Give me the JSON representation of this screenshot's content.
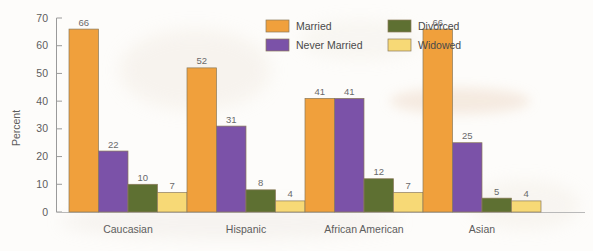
{
  "chart_data": {
    "type": "bar",
    "title": "",
    "xlabel": "",
    "ylabel": "Percent",
    "ylim": [
      0,
      70
    ],
    "yticks": [
      0,
      10,
      20,
      30,
      40,
      50,
      60,
      70
    ],
    "grid": false,
    "legend_position": "top-center",
    "categories": [
      "Caucasian",
      "Hispanic",
      "African American",
      "Asian"
    ],
    "series": [
      {
        "name": "Married",
        "color": "#f0a03c",
        "values": [
          66,
          52,
          41,
          66
        ]
      },
      {
        "name": "Never Married",
        "color": "#7b52a8",
        "values": [
          22,
          31,
          41,
          25
        ]
      },
      {
        "name": "Divorced",
        "color": "#5e7032",
        "values": [
          10,
          8,
          12,
          5
        ]
      },
      {
        "name": "Widowed",
        "color": "#f7d976",
        "values": [
          7,
          4,
          7,
          4
        ]
      }
    ],
    "value_labels": [
      [
        66,
        22,
        10,
        7
      ],
      [
        52,
        31,
        8,
        4
      ],
      [
        41,
        41,
        12,
        7
      ],
      [
        66,
        25,
        5,
        4
      ]
    ]
  },
  "legend": {
    "entries": [
      {
        "label": "Married"
      },
      {
        "label": "Divorced"
      },
      {
        "label": "Never Married"
      },
      {
        "label": "Widowed"
      }
    ]
  }
}
